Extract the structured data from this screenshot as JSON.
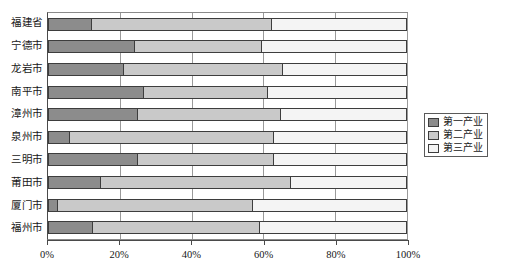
{
  "chart_data": {
    "type": "bar",
    "orientation": "horizontal",
    "stacked": true,
    "normalized": true,
    "title": "",
    "xlabel": "",
    "ylabel": "",
    "xlim": [
      0,
      100
    ],
    "xticks": [
      0,
      20,
      40,
      60,
      80,
      100
    ],
    "xticklabels": [
      "0%",
      "20%",
      "40%",
      "60%",
      "80%",
      "100%"
    ],
    "grid": true,
    "legend_position": "right",
    "categories": [
      "福建省",
      "宁德市",
      "龙岩市",
      "南平市",
      "漳州市",
      "泉州市",
      "三明市",
      "莆田市",
      "厦门市",
      "福州市"
    ],
    "series": [
      {
        "name": "第一产业",
        "color": "#8c8c8c",
        "values": [
          12.0,
          24.0,
          21.0,
          26.7,
          25.0,
          5.8,
          25.0,
          14.7,
          2.5,
          12.2
        ]
      },
      {
        "name": "第二产业",
        "color": "#c9c9c9",
        "values": [
          50.5,
          35.7,
          44.6,
          34.7,
          40.0,
          57.2,
          38.0,
          53.1,
          54.7,
          46.8
        ]
      },
      {
        "name": "第三产业",
        "color": "#f4f4f4",
        "values": [
          37.5,
          40.3,
          34.4,
          38.6,
          35.0,
          37.0,
          37.0,
          32.2,
          42.8,
          41.0
        ]
      }
    ]
  },
  "legend": {
    "items": [
      {
        "label": "第一产业"
      },
      {
        "label": "第二产业"
      },
      {
        "label": "第三产业"
      }
    ]
  }
}
